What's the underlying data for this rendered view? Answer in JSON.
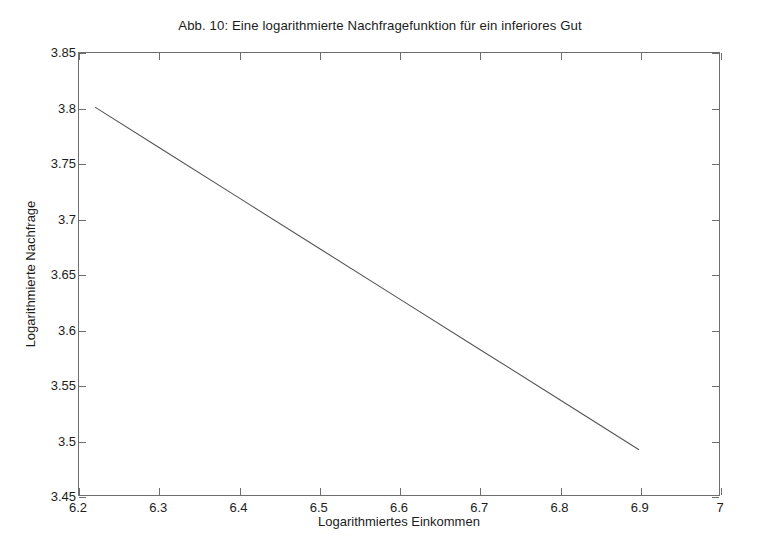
{
  "figure": {
    "title": "Abb. 10: Eine logarithmierte Nachfragefunktion für ein inferiores Gut",
    "background_color": "#ffffff",
    "axis_color": "#6e6e6e",
    "text_color": "#1c1c1c"
  },
  "chart_data": {
    "type": "line",
    "title": "Abb. 10: Eine logarithmierte Nachfragefunktion für ein inferiores Gut",
    "xlabel": "Logarithmiertes Einkommen",
    "ylabel": "Logarithmierte Nachfrage",
    "xlim": [
      6.2,
      7.0
    ],
    "ylim": [
      3.45,
      3.85
    ],
    "xticks": [
      6.2,
      6.3,
      6.4,
      6.5,
      6.6,
      6.7,
      6.8,
      6.9,
      7
    ],
    "yticks": [
      3.45,
      3.5,
      3.55,
      3.6,
      3.65,
      3.7,
      3.75,
      3.8,
      3.85
    ],
    "xtick_labels": [
      "6.2",
      "6.3",
      "6.4",
      "6.5",
      "6.6",
      "6.7",
      "6.8",
      "6.9",
      "7"
    ],
    "ytick_labels": [
      "3.45",
      "3.5",
      "3.55",
      "3.6",
      "3.65",
      "3.7",
      "3.75",
      "3.8",
      "3.85"
    ],
    "grid": false,
    "legend": null,
    "legend_position": "none",
    "line_color": "#555555",
    "line_width": 1,
    "series": [
      {
        "name": "Logarithmierte Nachfragefunktion",
        "x": [
          6.22,
          6.3,
          6.4,
          6.5,
          6.6,
          6.7,
          6.8,
          6.9
        ],
        "y": [
          3.801,
          3.7645,
          3.7189,
          3.6733,
          3.6277,
          3.5822,
          3.5366,
          3.491
        ],
        "slope": -0.456,
        "intercept": 6.637
      }
    ],
    "annotations": []
  }
}
